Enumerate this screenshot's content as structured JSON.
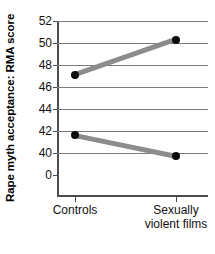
{
  "chart_data": {
    "type": "line",
    "title": "",
    "xlabel": "",
    "ylabel": "Rape myth acceptance: RMA score",
    "categories": [
      "Controls",
      "Sexually\nviolent films"
    ],
    "series": [
      {
        "name": "upper",
        "values": [
          47.1,
          50.3
        ]
      },
      {
        "name": "lower",
        "values": [
          41.6,
          39.7
        ]
      }
    ],
    "yticks": [
      52,
      50,
      48,
      46,
      44,
      42,
      40,
      0
    ],
    "ytick_labels": [
      "52",
      "50",
      "48",
      "46",
      "44",
      "42",
      "40",
      "0"
    ],
    "ylim": [
      40,
      52
    ],
    "axis_break": true,
    "grid": true,
    "legend": "none",
    "marker": "filled-circle",
    "marker_color": "#0d0d0d",
    "line_color": "#8c8c8c",
    "axis_color": "#4b4b4b",
    "grid_color": "#7c7c7c"
  },
  "axes": {
    "y_title": "Rape myth acceptance: RMA score",
    "y_tick_labels": [
      "52",
      "50",
      "48",
      "46",
      "44",
      "42",
      "40",
      "0"
    ],
    "x_tick_labels": [
      "Controls",
      "Sexually\nviolent films"
    ]
  }
}
